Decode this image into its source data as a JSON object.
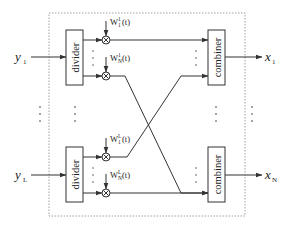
{
  "diagram": {
    "type": "signal-flow",
    "inputs": [
      {
        "base": "y",
        "sub": "1"
      },
      {
        "base": "y",
        "sub": "L"
      }
    ],
    "outputs": [
      {
        "base": "x",
        "sub": "1"
      },
      {
        "base": "x",
        "sub": "N"
      }
    ],
    "dividers": [
      {
        "label": "divider"
      },
      {
        "label": "divider"
      }
    ],
    "combiners": [
      {
        "label": "combiner"
      },
      {
        "label": "combiner"
      }
    ],
    "weights": [
      {
        "base": "W",
        "sub": "1",
        "sup": "1",
        "arg": "(t)"
      },
      {
        "base": "W",
        "sub": "N",
        "sup": "1",
        "arg": "(t)"
      },
      {
        "base": "W",
        "sub": "1",
        "sup": "L",
        "arg": "(t)"
      },
      {
        "base": "W",
        "sub": "N",
        "sup": "L",
        "arg": "(t)"
      }
    ],
    "multiplier_symbol": "×",
    "connections": [
      {
        "from": "divider-1 / W_1^1",
        "to": "combiner-1"
      },
      {
        "from": "divider-1 / W_N^1",
        "to": "combiner-N"
      },
      {
        "from": "divider-L / W_1^L",
        "to": "combiner-1"
      },
      {
        "from": "divider-L / W_N^L",
        "to": "combiner-N"
      }
    ],
    "colors": {
      "stroke": "#333333",
      "dashed_border": "#888888",
      "background": "#ffffff"
    }
  }
}
